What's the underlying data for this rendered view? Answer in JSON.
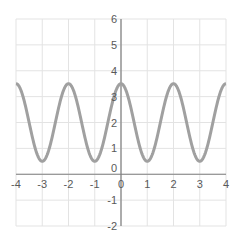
{
  "chart_data": {
    "type": "line",
    "title": "",
    "xlabel": "",
    "ylabel": "",
    "xlim": [
      -4,
      4
    ],
    "ylim": [
      -2,
      6
    ],
    "grid": true,
    "legend": null,
    "x_ticks": [
      -4,
      -3,
      -2,
      -1,
      0,
      1,
      2,
      3,
      4
    ],
    "y_ticks": [
      -2,
      -1,
      0,
      1,
      2,
      3,
      4,
      5,
      6
    ],
    "x_tick_labels": [
      "-4",
      "-3",
      "-2",
      "-1",
      "0",
      "1",
      "2",
      "3",
      "4"
    ],
    "y_tick_labels": [
      "-2",
      "-1",
      "0",
      "1",
      "2",
      "3",
      "4",
      "5",
      "6"
    ],
    "series": [
      {
        "name": "y = 2 + 1.5·cos(πx)",
        "color": "#a0a0a0",
        "x": [
          -4,
          -3.5,
          -3,
          -2.5,
          -2,
          -1.5,
          -1,
          -0.5,
          0,
          0.5,
          1,
          1.5,
          2,
          2.5,
          3,
          3.5,
          4
        ],
        "y": [
          3.5,
          2,
          0.5,
          2,
          3.5,
          2,
          0.5,
          2,
          3.5,
          2,
          0.5,
          2,
          3.5,
          2,
          0.5,
          2,
          3.5
        ]
      }
    ]
  },
  "colors": {
    "grid": "#e3e3e3",
    "axis": "#7f7f7f",
    "curve": "#a0a0a0",
    "label": "#595959"
  }
}
